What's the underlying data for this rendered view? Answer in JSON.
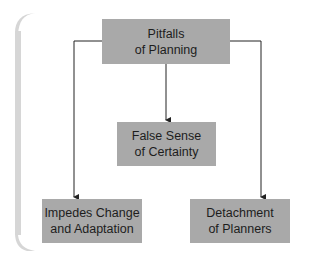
{
  "diagram": {
    "root": {
      "line1": "Pitfalls",
      "line2": "of Planning"
    },
    "children": [
      {
        "line1": "False Sense",
        "line2": "of Certainty"
      },
      {
        "line1": "Impedes Change",
        "line2": "and Adaptation"
      },
      {
        "line1": "Detachment",
        "line2": "of Planners"
      }
    ],
    "colors": {
      "box_fill": "#a9a9a9",
      "text": "#1d1d1d",
      "line": "#222222",
      "bracket": "#d6d6d6"
    }
  }
}
